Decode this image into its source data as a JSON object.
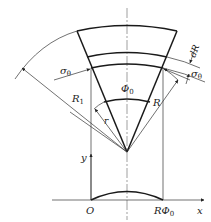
{
  "figure": {
    "labels": {
      "sigma_left": "σ",
      "sigma_left_sub": "θ",
      "sigma_right": "σ",
      "sigma_right_sub": "θ",
      "phi0": "Φ",
      "phi0_sub": "0",
      "R1": "R",
      "R1_sub": "1",
      "R": "R",
      "r": "r",
      "dR": "dR",
      "y_axis": "y",
      "x_axis": "x",
      "origin": "O",
      "R_phi0": "RΦ",
      "R_phi0_sub": "0"
    },
    "colors": {
      "line": "#1a1a1a",
      "centerline": "#777777",
      "background": "#ffffff"
    }
  }
}
